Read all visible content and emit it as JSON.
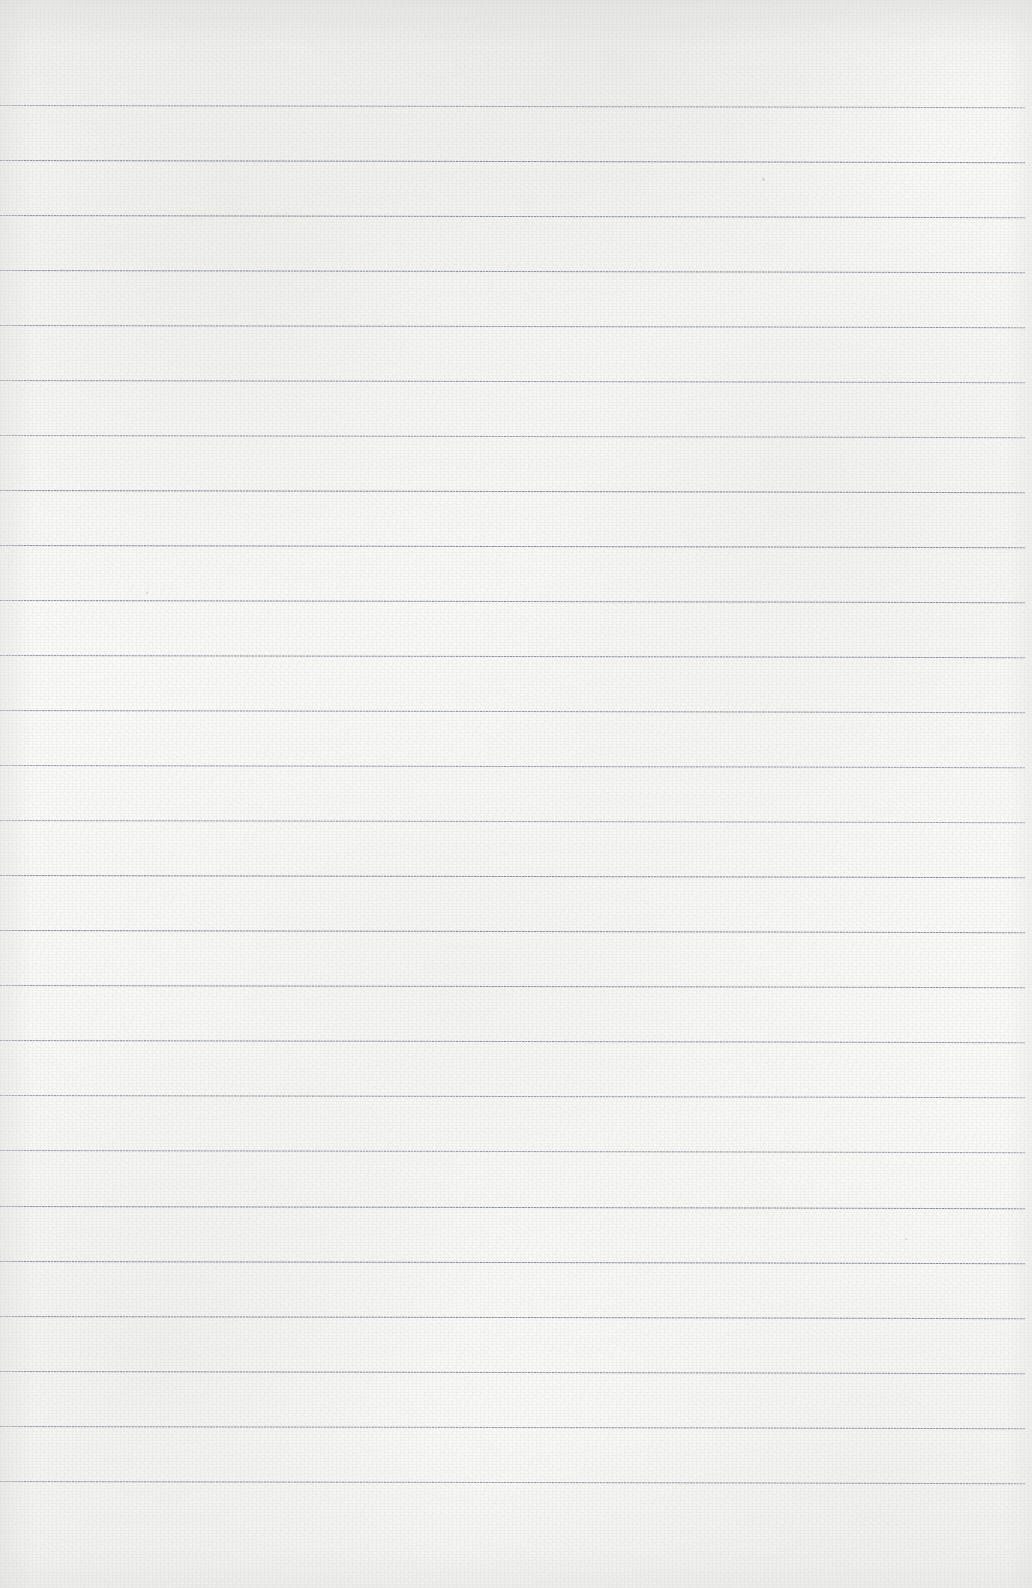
{
  "document": {
    "kind": "scanned-blank-ruled-paper",
    "title": "Blank Lined Paper",
    "page_width": 1032,
    "page_height": 1588,
    "text_content": "",
    "has_text": false,
    "has_handwriting": false,
    "orientation": "portrait"
  },
  "paper": {
    "base_color": "#f8f8f6",
    "shadow_tint": "#e7e7e5",
    "edge_shading_color": "#dadad8",
    "texture": "fibrous-grain",
    "top_margin_px": 104,
    "bottom_margin_px": 108,
    "left_margin_px": 0,
    "right_margin_px": 7
  },
  "ruling": {
    "line_color": "#787e8a",
    "line_halo_color": "#969ba5",
    "line_thickness_px": 2,
    "line_spacing_px": 55,
    "line_count": 26,
    "first_line_y": 104,
    "last_line_y": 1480,
    "line_start_x": 0,
    "line_end_x": 1025,
    "line_style": "stippled-solid",
    "skew_degrees": 0.12,
    "margin_rule": "none",
    "line_y_positions": [
      104,
      159,
      214,
      269,
      324,
      379,
      434,
      489,
      544,
      599,
      654,
      709,
      764,
      819,
      874,
      929,
      984,
      1039,
      1094,
      1149,
      1205,
      1260,
      1315,
      1370,
      1425,
      1480
    ]
  },
  "artifacts": {
    "specks": [
      {
        "x": 762,
        "y": 178,
        "size": 3
      },
      {
        "x": 146,
        "y": 592,
        "size": 2
      },
      {
        "x": 905,
        "y": 1238,
        "size": 2
      }
    ]
  }
}
